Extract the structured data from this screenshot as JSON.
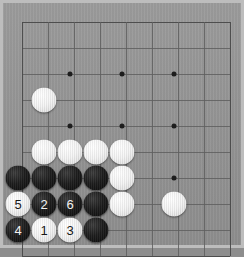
{
  "board": {
    "title": "Go board",
    "background_color": "#969696",
    "frame_color": "#bdbdbd",
    "line_color": "#5f5f5f",
    "star_point_color": "#1d1d1d",
    "black_stone_color": "#1e1e1e",
    "white_stone_color": "#f1f1f1",
    "grid": {
      "origin_x": 22,
      "origin_y": 22,
      "spacing": 26,
      "cols": 8,
      "rows": 9
    },
    "star_points": [
      {
        "name": "star-point-1",
        "x": 70,
        "y": 74
      },
      {
        "name": "star-point-2",
        "x": 122,
        "y": 74
      },
      {
        "name": "star-point-3",
        "x": 174,
        "y": 74
      },
      {
        "name": "star-point-4",
        "x": 70,
        "y": 126
      },
      {
        "name": "star-point-5",
        "x": 122,
        "y": 126
      },
      {
        "name": "star-point-6",
        "x": 174,
        "y": 126
      },
      {
        "name": "star-point-7",
        "x": 174,
        "y": 178
      }
    ],
    "stones": [
      {
        "name": "stone-white-a",
        "color": "white",
        "x": 44,
        "y": 100,
        "label": ""
      },
      {
        "name": "stone-white-b",
        "color": "white",
        "x": 44,
        "y": 152,
        "label": ""
      },
      {
        "name": "stone-white-c",
        "color": "white",
        "x": 70,
        "y": 152,
        "label": ""
      },
      {
        "name": "stone-white-d",
        "color": "white",
        "x": 96,
        "y": 152,
        "label": ""
      },
      {
        "name": "stone-white-e",
        "color": "white",
        "x": 122,
        "y": 152,
        "label": ""
      },
      {
        "name": "stone-black-a",
        "color": "black",
        "x": 18,
        "y": 178,
        "label": ""
      },
      {
        "name": "stone-black-b",
        "color": "black",
        "x": 44,
        "y": 178,
        "label": ""
      },
      {
        "name": "stone-black-c",
        "color": "black",
        "x": 70,
        "y": 178,
        "label": ""
      },
      {
        "name": "stone-black-d",
        "color": "black",
        "x": 96,
        "y": 178,
        "label": ""
      },
      {
        "name": "stone-white-f",
        "color": "white",
        "x": 122,
        "y": 178,
        "label": ""
      },
      {
        "name": "stone-move-5",
        "color": "white",
        "x": 18,
        "y": 204,
        "label": "5"
      },
      {
        "name": "stone-move-2",
        "color": "black",
        "x": 44,
        "y": 204,
        "label": "2"
      },
      {
        "name": "stone-move-6",
        "color": "black",
        "x": 70,
        "y": 204,
        "label": "6"
      },
      {
        "name": "stone-black-e",
        "color": "black",
        "x": 96,
        "y": 204,
        "label": ""
      },
      {
        "name": "stone-white-g",
        "color": "white",
        "x": 122,
        "y": 204,
        "label": ""
      },
      {
        "name": "stone-white-h",
        "color": "white",
        "x": 174,
        "y": 204,
        "label": ""
      },
      {
        "name": "stone-move-4",
        "color": "black",
        "x": 18,
        "y": 230,
        "label": "4"
      },
      {
        "name": "stone-move-1",
        "color": "white",
        "x": 44,
        "y": 230,
        "label": "1"
      },
      {
        "name": "stone-move-3",
        "color": "white",
        "x": 70,
        "y": 230,
        "label": "3"
      },
      {
        "name": "stone-black-f",
        "color": "black",
        "x": 96,
        "y": 230,
        "label": ""
      }
    ],
    "move_sequence": [
      {
        "number": "1",
        "color": "white"
      },
      {
        "number": "2",
        "color": "black"
      },
      {
        "number": "3",
        "color": "white"
      },
      {
        "number": "4",
        "color": "black"
      },
      {
        "number": "5",
        "color": "white"
      },
      {
        "number": "6",
        "color": "black"
      }
    ]
  }
}
